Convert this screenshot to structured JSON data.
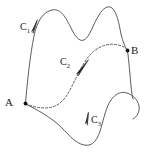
{
  "figure": {
    "type": "line-integral-paths-diagram",
    "background_color": "#ffffff",
    "stroke_color": "#4a4a4a",
    "label_color": "#1a1a1a",
    "points": [
      {
        "id": "A",
        "label": "A",
        "x": 25,
        "y": 103
      },
      {
        "id": "B",
        "label": "B",
        "x": 127,
        "y": 50
      }
    ],
    "curves": [
      {
        "id": "C1",
        "label": "C",
        "subscript": "1",
        "style": "solid",
        "from": "A",
        "to": "B",
        "description": "upper wavy path with two humps",
        "arrow_direction": "up-right"
      },
      {
        "id": "C2",
        "label": "C",
        "subscript": "2",
        "style": "dashed",
        "from": "A",
        "to": "B",
        "description": "middle dashed path dipping then arching",
        "arrow_direction": "up-right"
      },
      {
        "id": "C3",
        "label": "C",
        "subscript": "3",
        "style": "solid",
        "from": "A",
        "to": "B",
        "description": "lower path dipping below then rising right",
        "arrow_direction": "up"
      }
    ]
  }
}
